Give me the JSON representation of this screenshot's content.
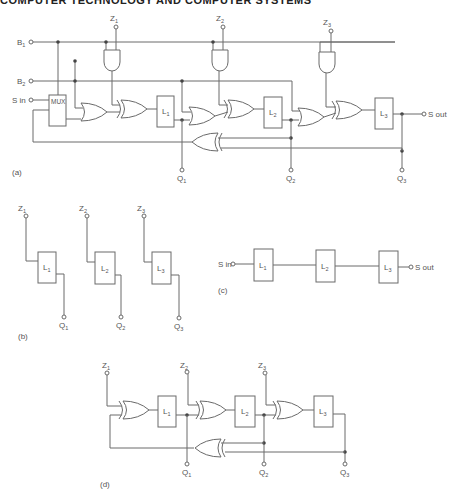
{
  "header": {
    "text": "COMPUTER TECHNOLOGY AND COMPUTER SYSTEMS"
  },
  "panel_a": {
    "caption": "(a)",
    "inputs": [
      {
        "name": "B",
        "sub": "1"
      },
      {
        "name": "B",
        "sub": "2"
      },
      {
        "name": "S in",
        "sub": ""
      }
    ],
    "mux_label": "MUX",
    "z_inputs": [
      {
        "name": "Z",
        "sub": "1"
      },
      {
        "name": "Z",
        "sub": "2"
      },
      {
        "name": "Z",
        "sub": "3"
      }
    ],
    "latches": [
      {
        "name": "L",
        "sub": "1"
      },
      {
        "name": "L",
        "sub": "2"
      },
      {
        "name": "L",
        "sub": "3"
      }
    ],
    "outputs": [
      {
        "name": "Q",
        "sub": "1"
      },
      {
        "name": "Q",
        "sub": "2"
      },
      {
        "name": "Q",
        "sub": "3"
      }
    ],
    "serial_out": "S out"
  },
  "panel_b": {
    "caption": "(b)",
    "z_inputs": [
      {
        "name": "Z",
        "sub": "1"
      },
      {
        "name": "Z",
        "sub": "2"
      },
      {
        "name": "Z",
        "sub": "3"
      }
    ],
    "latches": [
      {
        "name": "L",
        "sub": "1"
      },
      {
        "name": "L",
        "sub": "2"
      },
      {
        "name": "L",
        "sub": "3"
      }
    ],
    "outputs": [
      {
        "name": "Q",
        "sub": "1"
      },
      {
        "name": "Q",
        "sub": "2"
      },
      {
        "name": "Q",
        "sub": "3"
      }
    ]
  },
  "panel_c": {
    "caption": "(c)",
    "serial_in": "S in",
    "latches": [
      {
        "name": "L",
        "sub": "1"
      },
      {
        "name": "L",
        "sub": "2"
      },
      {
        "name": "L",
        "sub": "3"
      }
    ],
    "serial_out": "S out"
  },
  "panel_d": {
    "caption": "(d)",
    "z_inputs": [
      {
        "name": "Z",
        "sub": "1"
      },
      {
        "name": "Z",
        "sub": "2"
      },
      {
        "name": "Z",
        "sub": "3"
      }
    ],
    "latches": [
      {
        "name": "L",
        "sub": "1"
      },
      {
        "name": "L",
        "sub": "2"
      },
      {
        "name": "L",
        "sub": "3"
      }
    ],
    "outputs": [
      {
        "name": "Q",
        "sub": "1"
      },
      {
        "name": "Q",
        "sub": "2"
      },
      {
        "name": "Q",
        "sub": "3"
      }
    ]
  }
}
